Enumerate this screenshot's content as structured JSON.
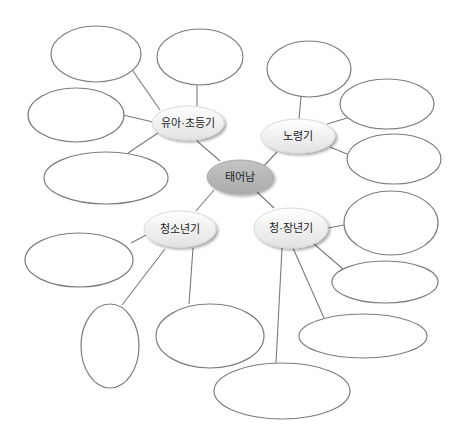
{
  "diagram": {
    "type": "mind-map",
    "colors": {
      "background": "#ffffff",
      "connector": "#7a7a7a",
      "blank_stroke": "#7d7d7d",
      "stage_fill_top": "#ffffff",
      "stage_fill_bottom": "#e4e4e4",
      "center_fill": "#b9b9b9"
    },
    "center": {
      "label": "태어남",
      "cx": 240,
      "cy": 177,
      "rx": 33,
      "ry": 17
    },
    "stages": [
      {
        "id": "infancy",
        "label": "유아·초등기",
        "cx": 188,
        "cy": 123,
        "rx": 36,
        "ry": 17,
        "link_to_center": [
          197,
          141,
          220,
          161
        ],
        "blanks": [
          {
            "cx": 96,
            "cy": 54,
            "rx": 45,
            "ry": 28,
            "line": [
              133,
              71,
              160,
              110
            ]
          },
          {
            "cx": 200,
            "cy": 57,
            "rx": 43,
            "ry": 28,
            "line": [
              197,
              85,
              197,
              106
            ]
          },
          {
            "cx": 76,
            "cy": 115,
            "rx": 48,
            "ry": 27,
            "line": [
              123,
              115,
              153,
              122
            ]
          },
          {
            "cx": 106,
            "cy": 178,
            "rx": 62,
            "ry": 26,
            "line": [
              128,
              153,
              158,
              133
            ]
          }
        ]
      },
      {
        "id": "old-age",
        "label": "노령기",
        "cx": 298,
        "cy": 136,
        "rx": 37,
        "ry": 17,
        "link_to_center": [
          262,
          168,
          277,
          152
        ],
        "blanks": [
          {
            "cx": 309,
            "cy": 69,
            "rx": 42,
            "ry": 28,
            "line": [
              301,
              97,
              299,
              119
            ]
          },
          {
            "cx": 387,
            "cy": 104,
            "rx": 47,
            "ry": 25,
            "line": [
              347,
              118,
              327,
              124
            ]
          },
          {
            "cx": 394,
            "cy": 159,
            "rx": 47,
            "ry": 25,
            "line": [
              347,
              154,
              330,
              147
            ]
          }
        ]
      },
      {
        "id": "adolescence",
        "label": "청소년기",
        "cx": 180,
        "cy": 229,
        "rx": 36,
        "ry": 18,
        "link_to_center": [
          214,
          190,
          196,
          211
        ],
        "blanks": [
          {
            "cx": 79,
            "cy": 260,
            "rx": 54,
            "ry": 27,
            "line": [
              131,
              243,
              150,
              233
            ]
          },
          {
            "cx": 110,
            "cy": 346,
            "rx": 29,
            "ry": 42,
            "line": [
              122,
              305,
              165,
              249
            ]
          },
          {
            "cx": 210,
            "cy": 336,
            "rx": 54,
            "ry": 32,
            "line": [
              189,
              304,
              193,
              248
            ]
          }
        ]
      },
      {
        "id": "adulthood",
        "label": "청·장년기",
        "cx": 291,
        "cy": 228,
        "rx": 37,
        "ry": 20,
        "link_to_center": [
          257,
          192,
          274,
          208
        ],
        "blanks": [
          {
            "cx": 391,
            "cy": 223,
            "rx": 47,
            "ry": 32,
            "line": [
              344,
              225,
              328,
              228
            ]
          },
          {
            "cx": 385,
            "cy": 282,
            "rx": 53,
            "ry": 21,
            "line": [
              343,
              269,
              314,
              244
            ]
          },
          {
            "cx": 363,
            "cy": 336,
            "rx": 64,
            "ry": 22,
            "line": [
              324,
              318,
              293,
              248
            ]
          },
          {
            "cx": 282,
            "cy": 391,
            "rx": 68,
            "ry": 28,
            "line": [
              276,
              363,
              282,
              248
            ]
          }
        ]
      }
    ]
  }
}
